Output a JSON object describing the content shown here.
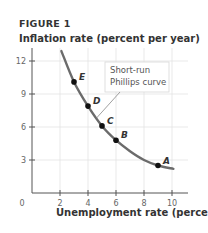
{
  "figure_label": "FIGURE 1",
  "chart_data": {
    "type": "line",
    "title": "FIGURE 1",
    "ylabel": "Inflation rate (percent per year)",
    "xlabel": "Unemployment rate (percent)",
    "xlim": [
      0,
      11
    ],
    "ylim": [
      0,
      13
    ],
    "xticks": [
      2,
      4,
      6,
      8,
      10
    ],
    "xtick_labels": [
      "2",
      "4",
      "6",
      "8",
      "10"
    ],
    "yticks": [
      3,
      6,
      9,
      12
    ],
    "ytick_labels": [
      "3",
      "6",
      "9",
      "12"
    ],
    "origin_label": "0",
    "grid": true,
    "series": [
      {
        "name": "Short-run Phillips curve",
        "x": [
          2.1,
          3,
          4,
          5,
          6,
          7,
          8,
          9,
          10.1
        ],
        "y": [
          12.9,
          10.1,
          7.9,
          6.1,
          4.8,
          3.8,
          3.0,
          2.5,
          2.2
        ]
      }
    ],
    "points": [
      {
        "label": "A",
        "x": 9,
        "y": 2.5
      },
      {
        "label": "B",
        "x": 6,
        "y": 4.8
      },
      {
        "label": "C",
        "x": 5,
        "y": 6.1
      },
      {
        "label": "D",
        "x": 4,
        "y": 7.9
      },
      {
        "label": "E",
        "x": 3,
        "y": 10.1
      }
    ],
    "annotations": [
      {
        "text_lines": [
          "Short-run",
          "Phillips curve"
        ],
        "points_to": {
          "x": 4.6,
          "y": 6.8
        }
      }
    ],
    "colors": {
      "curve": "#6b6b6b",
      "points": "#111111",
      "grid": "#e3e3e3",
      "axis": "#555555"
    }
  }
}
